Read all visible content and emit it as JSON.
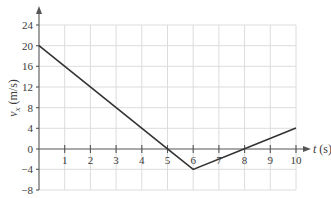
{
  "chart_data": {
    "type": "line",
    "title": "",
    "xlabel": "t (s)",
    "ylabel": "v_x (m/s)",
    "xlabel_var": "t",
    "xlabel_unit": "(s)",
    "ylabel_var": "v",
    "ylabel_sub": "x",
    "ylabel_unit": "(m/s)",
    "xlim": [
      0,
      10
    ],
    "ylim": [
      -8,
      24
    ],
    "grid": true,
    "x_ticks": [
      "1",
      "2",
      "3",
      "4",
      "5",
      "6",
      "7",
      "8",
      "9",
      "10"
    ],
    "y_ticks": [
      "24",
      "20",
      "16",
      "12",
      "8",
      "4",
      "0",
      "−4",
      "−8"
    ],
    "series": [
      {
        "name": "v_x",
        "x": [
          0,
          5,
          6,
          8,
          10
        ],
        "y": [
          20,
          0,
          -4,
          0,
          4
        ]
      }
    ],
    "colors": {
      "line": "#333333",
      "grid": "#d9d9d9",
      "axis": "#555555"
    }
  }
}
